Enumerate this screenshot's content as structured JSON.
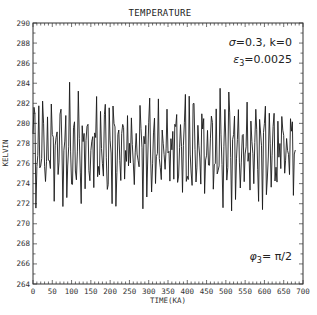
{
  "chart_data": {
    "type": "line",
    "title": "TEMPERATURE",
    "xlabel": "TIME(KA)",
    "ylabel": "KELVIN",
    "xlim": [
      0,
      700
    ],
    "ylim": [
      264,
      290
    ],
    "xticks": [
      0,
      50,
      100,
      150,
      200,
      250,
      300,
      350,
      400,
      450,
      500,
      550,
      600,
      650,
      700
    ],
    "yticks": [
      264,
      266,
      268,
      270,
      272,
      274,
      276,
      278,
      280,
      282,
      284,
      286,
      288,
      290
    ],
    "grid": false,
    "annotations": [
      {
        "text": "σ=0.3, k=0",
        "position": "top-right"
      },
      {
        "text": "ε₃=0.0025",
        "position": "top-right-second-line"
      },
      {
        "text": "φ₃=π/2",
        "position": "bottom-right"
      }
    ],
    "series": [
      {
        "name": "temperature",
        "color": "#1a1a1a",
        "x_start": 0,
        "x_step": 2.5,
        "x_end": 680,
        "values_summary": {
          "mean": 277.5,
          "max": 284.1,
          "min": 268.9
        },
        "values": []
      }
    ]
  },
  "labels": {
    "title": "TEMPERATURE",
    "xlabel": "TIME(KA)",
    "ylabel": "KELVIN",
    "annot1_sigma": "σ",
    "annot1_rest": "=0.3, k=0",
    "annot2_eps": "ε",
    "annot2_sub": "3",
    "annot2_rest": "=0.0025",
    "annot3_phi": "φ",
    "annot3_sub": "3",
    "annot3_rest": "= π/2"
  }
}
